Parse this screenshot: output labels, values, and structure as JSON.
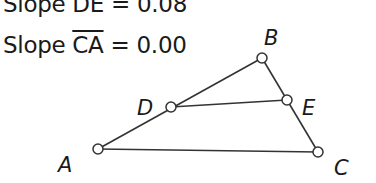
{
  "measurements": [
    {
      "prefix": "Slope ",
      "segment": "DE",
      "equals": " = ",
      "value": "0.08"
    },
    {
      "prefix": "Slope ",
      "segment": "CA",
      "equals": " = ",
      "value": "0.00"
    }
  ],
  "points": {
    "A": {
      "label": "A",
      "x": 98,
      "y": 149
    },
    "B": {
      "label": "B",
      "x": 262,
      "y": 58
    },
    "C": {
      "label": "C",
      "x": 318,
      "y": 152
    },
    "D": {
      "label": "D",
      "x": 171,
      "y": 107
    },
    "E": {
      "label": "E",
      "x": 287,
      "y": 100
    }
  },
  "segments": [
    "AB",
    "BC",
    "CA",
    "DE"
  ],
  "colors": {
    "stroke": "#333333",
    "text": "#1a1a1a",
    "point_fill": "#ffffff"
  }
}
